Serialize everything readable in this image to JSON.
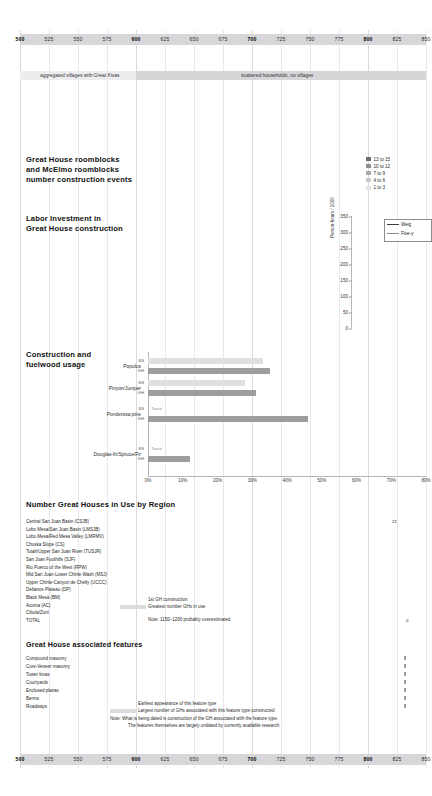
{
  "page": {
    "width": 426,
    "height": 796,
    "background": "#ffffff"
  },
  "colors": {
    "axis_bar": "#d7d7d9",
    "grid_minor": "#e9e9ec",
    "grid_major": "#dadade",
    "band_light": "#ededf0",
    "band_mid": "#d6d6d9",
    "bar_dark": "#8a8a8d",
    "bar_mid": "#b4b4b7",
    "bar_light": "#e0e0e3",
    "bar_pale": "#f0f0f2",
    "text": "#262626"
  },
  "time_axis": {
    "start": 500,
    "end": 850,
    "tick_step": 25,
    "major_step": 100,
    "ticks": [
      500,
      525,
      550,
      575,
      600,
      625,
      650,
      675,
      700,
      725,
      750,
      775,
      800,
      825,
      850
    ],
    "major_ticks": [
      500,
      600,
      700,
      800
    ]
  },
  "settlement": {
    "bands": [
      {
        "label": "aggregated villages with Great Kivas",
        "start": 500,
        "end": 600,
        "shade": "#ededf0"
      },
      {
        "label": "scattered households, no villages",
        "start": 600,
        "end": 850,
        "shade": "#d6d6d9"
      }
    ]
  },
  "roomblocks": {
    "title_lines": [
      "Great House roomblocks",
      "and McElmo roomblocks",
      "number construction events"
    ],
    "legend": [
      {
        "label": "13 to 15",
        "color": "#6e6e71"
      },
      {
        "label": "10 to 12",
        "color": "#8e8e91"
      },
      {
        "label": "7 to 9",
        "color": "#aaaaad"
      },
      {
        "label": "4 to 6",
        "color": "#c9c9cc"
      },
      {
        "label": "1 to 3",
        "color": "#e6e6e9"
      }
    ]
  },
  "labor": {
    "title_lines": [
      "Labor Investment in",
      "Great House construction"
    ],
    "ylabel": "Person-hours / 1000",
    "yticks": [
      350,
      300,
      250,
      200,
      150,
      100,
      50,
      0
    ],
    "legend": [
      {
        "label": "Weig",
        "color": "#3c3c3f"
      },
      {
        "label": "Five-y",
        "color": "#8a8a8d"
      }
    ]
  },
  "fuelwood": {
    "title_lines": [
      "Construction and",
      "fuelwood usage"
    ],
    "sub_labels": {
      "ss": "SS",
      "gh": "GH"
    },
    "xticks": [
      "0%",
      "10%",
      "20%",
      "30%",
      "40%",
      "50%",
      "60%",
      "70%",
      "80%"
    ],
    "trace_text": "Trace"
  },
  "chart_data": [
    {
      "type": "bar",
      "title": "Construction and fuelwood usage",
      "orientation": "horizontal",
      "xlabel": "",
      "ylabel": "",
      "xlim": [
        0,
        80
      ],
      "xtick_values": [
        0,
        10,
        20,
        30,
        40,
        50,
        60,
        70,
        80
      ],
      "xtick_labels": [
        "0%",
        "10%",
        "20%",
        "30%",
        "40%",
        "50%",
        "60%",
        "70%",
        "80%"
      ],
      "categories": [
        "Populus",
        "Pinyon/Juniper",
        "Ponderosa pine",
        "Douglas-fir/Spruce/Fir"
      ],
      "series": [
        {
          "name": "SS",
          "values": [
            33,
            28,
            0,
            0
          ],
          "note": [
            "",
            "",
            "Trace",
            "Trace"
          ],
          "color": "#e0e0e3"
        },
        {
          "name": "GH",
          "values": [
            35,
            31,
            46,
            12
          ],
          "note": [
            "",
            "",
            "",
            ""
          ],
          "color": "#9d9da0"
        }
      ]
    },
    {
      "type": "bar",
      "title": "Number Great Houses in Use by Region",
      "orientation": "horizontal-timeline",
      "xlabel": "Years AD",
      "xlim": [
        500,
        850
      ],
      "categories": [
        "Central San Juan Basin (CSJB)",
        "Lobo Mesa/San Juan Basin (LMSJB)",
        "Lobo Mesa/Red Mesa Valley (LMRMV)",
        "Chuska Slope (CS)",
        "Totah/Upper San Juan River (TUSJR)",
        "San Juan Foothills (SJF)",
        "Rio Puerco of the West (RPW)",
        "Mid San Juan-Lower Chinle Wash (MSJ)",
        "Upper Chinle-Canyon de Chelly (UCCC)",
        "Defiance Plateau (DP)",
        "Black Mesa (BM)",
        "Acoma (AC)",
        "Cibola/Zuni",
        "TOTAL"
      ],
      "values": [
        21,
        0,
        0,
        0,
        0,
        0,
        0,
        0,
        0,
        0,
        0,
        0,
        0,
        0
      ],
      "value_labels": [
        "21",
        "",
        "",
        "",
        "",
        "",
        "",
        "",
        "",
        "",
        "",
        "",
        "",
        "0"
      ]
    },
    {
      "type": "bar",
      "title": "Labor Investment in Great House construction",
      "orientation": "vertical",
      "ylabel": "Person-hours / 1000",
      "ylim": [
        0,
        350
      ],
      "ytick_values": [
        0,
        50,
        100,
        150,
        200,
        250,
        300,
        350
      ],
      "ytick_labels": [
        "0",
        "50",
        "100",
        "150",
        "200",
        "250",
        "300",
        "350"
      ],
      "series": [
        {
          "name": "Weig",
          "values": [],
          "color": "#3c3c3f"
        },
        {
          "name": "Five-y",
          "values": [],
          "color": "#8a8a8d"
        }
      ]
    }
  ],
  "regions": {
    "title": "Number Great Houses in Use by Region",
    "rows": [
      {
        "label": "Central San Juan Basin (CSJB)",
        "value": "21"
      },
      {
        "label": "Lobo Mesa/San Juan Basin (LMSJB)",
        "value": ""
      },
      {
        "label": "Lobo Mesa/Red Mesa Valley (LMRMV)",
        "value": ""
      },
      {
        "label": "Chuska Slope (CS)",
        "value": ""
      },
      {
        "label": "Totah/Upper San Juan River (TUSJR)",
        "value": ""
      },
      {
        "label": "San Juan Foothills (SJF)",
        "value": ""
      },
      {
        "label": "Rio Puerco of the West (RPW)",
        "value": ""
      },
      {
        "label": "Mid San Juan-Lower Chinle Wash (MSJ)",
        "value": ""
      },
      {
        "label": "Upper Chinle-Canyon de Chelly (UCCC)",
        "value": ""
      },
      {
        "label": "Defiance Plateau (DP)",
        "value": ""
      },
      {
        "label": "Black Mesa (BM)",
        "value": ""
      },
      {
        "label": "Acoma (AC)",
        "value": ""
      },
      {
        "label": "Cibola/Zuni",
        "value": ""
      },
      {
        "label": "TOTAL",
        "value": "0"
      }
    ],
    "key": [
      {
        "label": "1st GH construction",
        "swatch": "none"
      },
      {
        "label": "Greatest number GHs in use",
        "swatch": "#dcdce0"
      }
    ],
    "note": "Note:  1150–1200 probably overestimated"
  },
  "features": {
    "title": "Great House associated features",
    "rows": [
      "Compound masonry",
      "Core-Veneer masonry",
      "Tower kivas",
      "Courtyards",
      "Enclosed plazas",
      "Berms",
      "Roadways"
    ],
    "key": [
      {
        "label": "Earliest appearance of this feature type",
        "swatch": "none"
      },
      {
        "label": "Largest number of GHs associated with this feature type constructed",
        "swatch": "#dcdce0"
      }
    ],
    "notes": [
      "Note:  What is being dated is construction of the GH associated with the feature type.",
      "The features themselves are largely undated by currently available research."
    ]
  }
}
